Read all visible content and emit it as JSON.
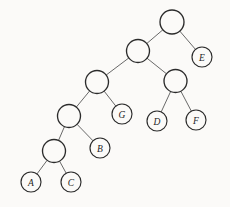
{
  "figure": {
    "kind": "binary-tree-diagram",
    "title": "",
    "background_color": "#fbfaf8",
    "edge_color": "#585858",
    "node_stroke_color": "#2b2b2b",
    "node_fill_color": "#fbfaf8",
    "label_color": "#1e1e1e"
  },
  "chart_data": {
    "type": "diagram",
    "subtype": "binary-tree",
    "title": "",
    "xlabel": "",
    "ylabel": "",
    "nodes": [
      {
        "id": "root",
        "label": "",
        "x": 172,
        "y": 22,
        "r": 12,
        "leaf": false,
        "depth": 0
      },
      {
        "id": "n1",
        "label": "",
        "x": 138,
        "y": 51,
        "r": 11.5,
        "leaf": false,
        "depth": 1
      },
      {
        "id": "E",
        "label": "E",
        "x": 202,
        "y": 57,
        "r": 10,
        "leaf": true,
        "depth": 1
      },
      {
        "id": "n2",
        "label": "",
        "x": 97,
        "y": 82,
        "r": 11.5,
        "leaf": false,
        "depth": 2
      },
      {
        "id": "n3",
        "label": "",
        "x": 175.5,
        "y": 81,
        "r": 11.5,
        "leaf": false,
        "depth": 2
      },
      {
        "id": "n4",
        "label": "",
        "x": 69,
        "y": 116,
        "r": 11.5,
        "leaf": false,
        "depth": 3
      },
      {
        "id": "G",
        "label": "G",
        "x": 122,
        "y": 114,
        "r": 10,
        "leaf": true,
        "depth": 3
      },
      {
        "id": "D",
        "label": "D",
        "x": 157,
        "y": 121,
        "r": 10,
        "leaf": true,
        "depth": 3
      },
      {
        "id": "F",
        "label": "F",
        "x": 196,
        "y": 120,
        "r": 10,
        "leaf": true,
        "depth": 3
      },
      {
        "id": "n5",
        "label": "",
        "x": 54,
        "y": 151,
        "r": 11.5,
        "leaf": false,
        "depth": 4
      },
      {
        "id": "B",
        "label": "B",
        "x": 100,
        "y": 148,
        "r": 10,
        "leaf": true,
        "depth": 4
      },
      {
        "id": "A",
        "label": "A",
        "x": 31,
        "y": 182,
        "r": 10,
        "leaf": true,
        "depth": 5
      },
      {
        "id": "C",
        "label": "C",
        "x": 71,
        "y": 182,
        "r": 10,
        "leaf": true,
        "depth": 5
      }
    ],
    "edges": [
      {
        "from": "root",
        "to": "n1",
        "side": "left"
      },
      {
        "from": "root",
        "to": "E",
        "side": "right"
      },
      {
        "from": "n1",
        "to": "n2",
        "side": "left"
      },
      {
        "from": "n1",
        "to": "n3",
        "side": "right"
      },
      {
        "from": "n3",
        "to": "D",
        "side": "left"
      },
      {
        "from": "n3",
        "to": "F",
        "side": "right"
      },
      {
        "from": "n2",
        "to": "n4",
        "side": "left"
      },
      {
        "from": "n2",
        "to": "G",
        "side": "right"
      },
      {
        "from": "n4",
        "to": "n5",
        "side": "left"
      },
      {
        "from": "n4",
        "to": "B",
        "side": "right"
      },
      {
        "from": "n5",
        "to": "A",
        "side": "left"
      },
      {
        "from": "n5",
        "to": "C",
        "side": "right"
      }
    ],
    "leaf_labels": [
      "A",
      "C",
      "B",
      "G",
      "D",
      "F",
      "E"
    ],
    "internal_node_count": 6,
    "leaf_count": 7,
    "max_depth": 5,
    "legend": [],
    "annotations": [],
    "grid": false
  }
}
